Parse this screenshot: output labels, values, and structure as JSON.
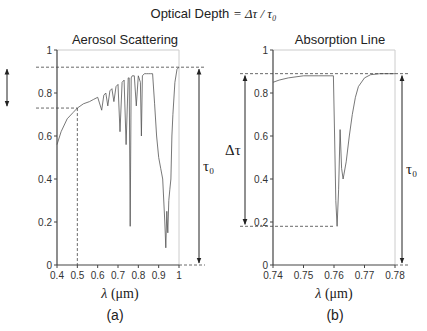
{
  "figure": {
    "title_prefix": "Optical Depth ",
    "title_math": "= Δτ / τ₀",
    "left_title": "Aerosol Scattering",
    "right_title": "Absorption Line",
    "left_caption": "(a)",
    "right_caption": "(b)",
    "left_xlabel_sym": "λ",
    "left_xlabel_unit": " (μm)",
    "right_xlabel_sym": "λ",
    "right_xlabel_unit": " (μm)",
    "delta_tau_label": "Δτ",
    "tau0_label": "τ₀"
  },
  "chart_data": [
    {
      "type": "line",
      "title": "Aerosol Scattering",
      "xlabel": "λ (μm)",
      "ylabel": "",
      "xlim": [
        0.4,
        1.0
      ],
      "ylim": [
        0,
        1
      ],
      "xticks": [
        "0.4",
        "0.5",
        "0.6",
        "0.7",
        "0.8",
        "0.9",
        "1"
      ],
      "yticks": [
        "0",
        "0.2",
        "0.4",
        "0.6",
        "0.8",
        "1"
      ],
      "grid": false,
      "caption": "(a)",
      "annotations": {
        "delta_tau": {
          "from": 0.73,
          "to": 0.92,
          "label": "Δτ"
        },
        "tau0": {
          "from": 0,
          "to": 0.92,
          "label": "τ₀"
        },
        "reference_x": 0.5,
        "reference_y": 0.73
      },
      "x": [
        0.4,
        0.42,
        0.45,
        0.48,
        0.5,
        0.53,
        0.56,
        0.58,
        0.6,
        0.62,
        0.63,
        0.64,
        0.65,
        0.66,
        0.67,
        0.68,
        0.69,
        0.7,
        0.71,
        0.72,
        0.73,
        0.74,
        0.75,
        0.755,
        0.76,
        0.765,
        0.77,
        0.78,
        0.79,
        0.8,
        0.81,
        0.815,
        0.82,
        0.83,
        0.84,
        0.85,
        0.86,
        0.87,
        0.88,
        0.89,
        0.9,
        0.91,
        0.92,
        0.93,
        0.935,
        0.94,
        0.945,
        0.95,
        0.955,
        0.96,
        0.965,
        0.97,
        0.98,
        0.99,
        1.0
      ],
      "values": [
        0.56,
        0.62,
        0.68,
        0.71,
        0.73,
        0.75,
        0.76,
        0.77,
        0.78,
        0.72,
        0.79,
        0.8,
        0.74,
        0.81,
        0.82,
        0.76,
        0.83,
        0.84,
        0.62,
        0.85,
        0.86,
        0.56,
        0.87,
        0.87,
        0.18,
        0.87,
        0.88,
        0.88,
        0.74,
        0.88,
        0.85,
        0.6,
        0.88,
        0.89,
        0.89,
        0.89,
        0.89,
        0.89,
        0.75,
        0.6,
        0.5,
        0.45,
        0.4,
        0.2,
        0.08,
        0.25,
        0.15,
        0.3,
        0.35,
        0.4,
        0.6,
        0.7,
        0.85,
        0.91,
        0.92
      ]
    },
    {
      "type": "line",
      "title": "Absorption Line",
      "xlabel": "λ (μm)",
      "ylabel": "",
      "xlim": [
        0.74,
        0.78
      ],
      "ylim": [
        0,
        1
      ],
      "xticks": [
        "0.74",
        "0.75",
        "0.76",
        "0.77",
        "0.78"
      ],
      "yticks": [
        "0",
        "0.2",
        "0.4",
        "0.6",
        "0.8",
        "1"
      ],
      "grid": false,
      "caption": "(b)",
      "annotations": {
        "delta_tau": {
          "from": 0.18,
          "to": 0.89,
          "label": "Δτ"
        },
        "tau0": {
          "from": 0,
          "to": 0.89,
          "label": "τ₀"
        },
        "reference_y_top": 0.89,
        "reference_y_bottom": 0.18
      },
      "x": [
        0.74,
        0.742,
        0.745,
        0.75,
        0.755,
        0.759,
        0.7598,
        0.7602,
        0.7606,
        0.761,
        0.7615,
        0.762,
        0.7625,
        0.763,
        0.764,
        0.765,
        0.766,
        0.767,
        0.768,
        0.77,
        0.772,
        0.775,
        0.78
      ],
      "values": [
        0.85,
        0.86,
        0.87,
        0.88,
        0.88,
        0.88,
        0.88,
        0.6,
        0.3,
        0.18,
        0.35,
        0.63,
        0.45,
        0.4,
        0.48,
        0.6,
        0.7,
        0.78,
        0.83,
        0.87,
        0.885,
        0.89,
        0.89
      ]
    }
  ]
}
